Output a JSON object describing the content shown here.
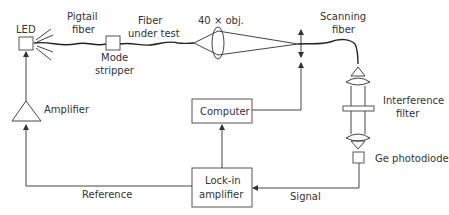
{
  "diagram": {
    "labels": {
      "led": "LED",
      "pigtail_1": "Pigtail",
      "pigtail_2": "fiber",
      "fiber_test_1": "Fiber",
      "fiber_test_2": "under test",
      "objective": "40 × obj.",
      "scanning_1": "Scanning",
      "scanning_2": "fiber",
      "mode_1": "Mode",
      "mode_2": "stripper",
      "amplifier": "Amplifier",
      "computer": "Computer",
      "interference_1": "Interference",
      "interference_2": "filter",
      "photodiode": "Ge photodiode",
      "lockin_1": "Lock-in",
      "lockin_2": "amplifier",
      "reference": "Reference",
      "signal": "Signal"
    },
    "colors": {
      "line": "#444444",
      "text": "#333333",
      "background": "#ffffff"
    }
  }
}
